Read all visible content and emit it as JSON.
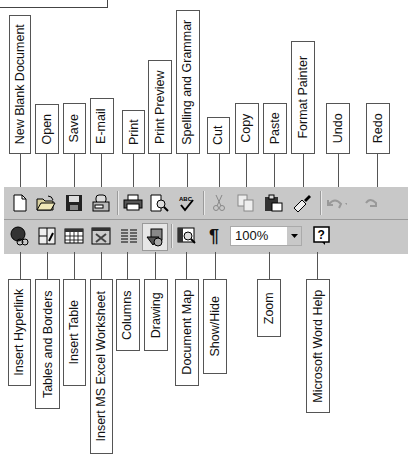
{
  "toolbar_top": {
    "buttons": [
      {
        "id": "new",
        "label": "New Blank Document",
        "icon": "new-document-icon"
      },
      {
        "id": "open",
        "label": "Open",
        "icon": "open-folder-icon"
      },
      {
        "id": "save",
        "label": "Save",
        "icon": "floppy-disk-icon"
      },
      {
        "id": "email",
        "label": "E-mail",
        "icon": "email-icon"
      },
      {
        "id": "print",
        "label": "Print",
        "icon": "printer-icon"
      },
      {
        "id": "preview",
        "label": "Print Preview",
        "icon": "print-preview-icon"
      },
      {
        "id": "spelling",
        "label": "Spelling and Grammar",
        "icon": "spell-check-icon"
      },
      {
        "id": "cut",
        "label": "Cut",
        "icon": "scissors-icon"
      },
      {
        "id": "copy",
        "label": "Copy",
        "icon": "copy-icon"
      },
      {
        "id": "paste",
        "label": "Paste",
        "icon": "clipboard-icon"
      },
      {
        "id": "painter",
        "label": "Format Painter",
        "icon": "paintbrush-icon"
      },
      {
        "id": "undo",
        "label": "Undo",
        "icon": "undo-icon"
      },
      {
        "id": "redo",
        "label": "Redo",
        "icon": "redo-icon"
      }
    ]
  },
  "toolbar_bottom": {
    "buttons": [
      {
        "id": "hyperlink",
        "label": "Insert Hyperlink",
        "icon": "globe-link-icon"
      },
      {
        "id": "tables_borders",
        "label": "Tables and Borders",
        "icon": "table-pencil-icon"
      },
      {
        "id": "insert_table",
        "label": "Insert Table",
        "icon": "table-grid-icon"
      },
      {
        "id": "excel",
        "label": "Insert MS Excel Worksheet",
        "icon": "excel-sheet-icon"
      },
      {
        "id": "columns",
        "label": "Columns",
        "icon": "columns-icon"
      },
      {
        "id": "drawing",
        "label": "Drawing",
        "icon": "drawing-shapes-icon"
      },
      {
        "id": "docmap",
        "label": "Document Map",
        "icon": "document-map-icon"
      },
      {
        "id": "showhide",
        "label": "Show/Hide",
        "icon": "pilcrow-icon",
        "glyph": "¶"
      },
      {
        "id": "zoom",
        "label": "Zoom",
        "icon": "zoom-dropdown"
      },
      {
        "id": "help",
        "label": "Microsoft Word Help",
        "icon": "help-question-icon",
        "glyph": "?"
      }
    ],
    "zoom_value": "100%"
  },
  "colors": {
    "toolbar_bg": "#c8c8c8",
    "border": "#555555"
  }
}
